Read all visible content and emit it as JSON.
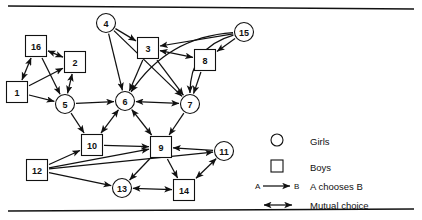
{
  "figure": {
    "kind": "sociogram",
    "background": "#ffffff",
    "ink": "#111111"
  },
  "nodes": [
    {
      "id": "1",
      "label": "1",
      "shape": "square",
      "sex": "Boys",
      "x": 17,
      "y": 92
    },
    {
      "id": "2",
      "label": "2",
      "shape": "square",
      "sex": "Boys",
      "x": 75,
      "y": 62
    },
    {
      "id": "3",
      "label": "3",
      "shape": "square",
      "sex": "Boys",
      "x": 148,
      "y": 48
    },
    {
      "id": "4",
      "label": "4",
      "shape": "circle",
      "sex": "Girls",
      "x": 106,
      "y": 23
    },
    {
      "id": "5",
      "label": "5",
      "shape": "circle",
      "sex": "Girls",
      "x": 65,
      "y": 104
    },
    {
      "id": "6",
      "label": "6",
      "shape": "circle",
      "sex": "Girls",
      "x": 125,
      "y": 101
    },
    {
      "id": "7",
      "label": "7",
      "shape": "circle",
      "sex": "Girls",
      "x": 190,
      "y": 104
    },
    {
      "id": "8",
      "label": "8",
      "shape": "square",
      "sex": "Boys",
      "x": 205,
      "y": 60
    },
    {
      "id": "9",
      "label": "9",
      "shape": "square",
      "sex": "Boys",
      "x": 161,
      "y": 147
    },
    {
      "id": "10",
      "label": "10",
      "shape": "square",
      "sex": "Boys",
      "x": 92,
      "y": 145
    },
    {
      "id": "11",
      "label": "11",
      "shape": "circle",
      "sex": "Girls",
      "x": 224,
      "y": 151
    },
    {
      "id": "12",
      "label": "12",
      "shape": "square",
      "sex": "Boys",
      "x": 37,
      "y": 170
    },
    {
      "id": "13",
      "label": "13",
      "shape": "circle",
      "sex": "Girls",
      "x": 122,
      "y": 188
    },
    {
      "id": "14",
      "label": "14",
      "shape": "square",
      "sex": "Boys",
      "x": 184,
      "y": 190
    },
    {
      "id": "15",
      "label": "15",
      "shape": "circle",
      "sex": "Girls",
      "x": 244,
      "y": 32
    },
    {
      "id": "16",
      "label": "16",
      "shape": "square",
      "sex": "Boys",
      "x": 36,
      "y": 46
    }
  ],
  "edges": [
    {
      "from": "16",
      "to": "2",
      "type": "mutual"
    },
    {
      "from": "16",
      "to": "1",
      "type": "mutual"
    },
    {
      "from": "16",
      "to": "5",
      "type": "choice"
    },
    {
      "from": "1",
      "to": "2",
      "type": "choice"
    },
    {
      "from": "1",
      "to": "5",
      "type": "choice"
    },
    {
      "from": "2",
      "to": "5",
      "type": "mutual"
    },
    {
      "from": "5",
      "to": "6",
      "type": "choice"
    },
    {
      "from": "5",
      "to": "10",
      "type": "choice"
    },
    {
      "from": "4",
      "to": "3",
      "type": "choice"
    },
    {
      "from": "4",
      "to": "6",
      "type": "choice"
    },
    {
      "from": "4",
      "to": "7",
      "type": "choice"
    },
    {
      "from": "3",
      "to": "8",
      "type": "mutual"
    },
    {
      "from": "3",
      "to": "6",
      "type": "choice"
    },
    {
      "from": "3",
      "to": "7",
      "type": "choice"
    },
    {
      "from": "8",
      "to": "7",
      "type": "choice"
    },
    {
      "from": "15",
      "to": "3",
      "type": "choice"
    },
    {
      "from": "15",
      "to": "8",
      "type": "choice"
    },
    {
      "from": "15",
      "to": "7",
      "type": "choice",
      "curve": "left"
    },
    {
      "from": "15",
      "to": "6",
      "type": "choice",
      "curve": "left"
    },
    {
      "from": "6",
      "to": "7",
      "type": "mutual"
    },
    {
      "from": "6",
      "to": "10",
      "type": "mutual"
    },
    {
      "from": "6",
      "to": "9",
      "type": "mutual"
    },
    {
      "from": "7",
      "to": "9",
      "type": "choice"
    },
    {
      "from": "10",
      "to": "9",
      "type": "choice"
    },
    {
      "from": "12",
      "to": "10",
      "type": "choice"
    },
    {
      "from": "12",
      "to": "9",
      "type": "choice"
    },
    {
      "from": "12",
      "to": "13",
      "type": "choice"
    },
    {
      "from": "9",
      "to": "13",
      "type": "choice"
    },
    {
      "from": "9",
      "to": "14",
      "type": "choice"
    },
    {
      "from": "11",
      "to": "9",
      "type": "choice"
    },
    {
      "from": "11",
      "to": "14",
      "type": "mutual"
    },
    {
      "from": "13",
      "to": "14",
      "type": "mutual"
    },
    {
      "from": "12",
      "to": "11",
      "type": "choice"
    }
  ],
  "legend": {
    "items": [
      {
        "key": "girls",
        "glyph": "circle-glyph",
        "label": "Girls"
      },
      {
        "key": "boys",
        "glyph": "square-glyph",
        "label": "Boys"
      },
      {
        "key": "choice",
        "glyph": "single-arrow-glyph",
        "label": "A chooses B",
        "from_label": "A",
        "to_label": "B"
      },
      {
        "key": "mutual",
        "glyph": "double-arrow-glyph",
        "label": "Mutual choice"
      }
    ]
  }
}
